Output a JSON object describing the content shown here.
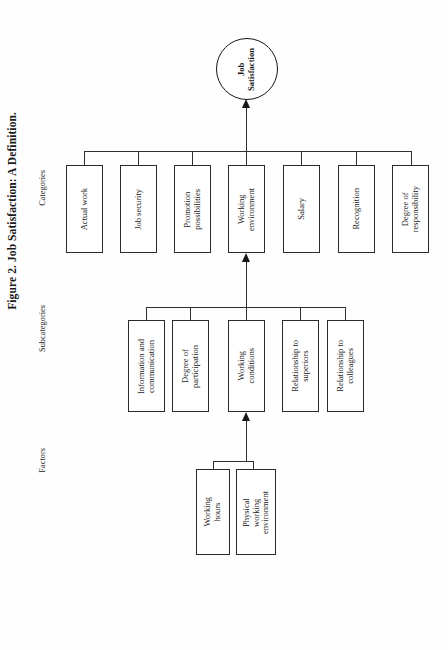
{
  "figure": {
    "title": "Figure 2. Job Satisfaction: A Definition.",
    "root_node": "Job\nSatisfaction"
  },
  "row_labels": {
    "categories": "Categories",
    "subcategories": "Subcategories",
    "factors": "Factors"
  },
  "categories": [
    {
      "label": "Actual work"
    },
    {
      "label": "Job security"
    },
    {
      "label": "Promotion\npossibilities"
    },
    {
      "label": "Working\nenvironment"
    },
    {
      "label": "Salary"
    },
    {
      "label": "Recognition"
    },
    {
      "label": "Degree of\nresponsibility"
    }
  ],
  "subcategories": [
    {
      "label": "Information and\ncommunication"
    },
    {
      "label": "Degree of\nparticipation"
    },
    {
      "label": "Working\nconditions"
    },
    {
      "label": "Relationship to\nsuperiors"
    },
    {
      "label": "Relationship to\ncolleagues"
    }
  ],
  "factors": [
    {
      "label": "Working\nhours"
    },
    {
      "label": "Physical\nworking\nenvironment"
    }
  ],
  "colors": {
    "ink": "#1a1a1a",
    "line": "#2e2e2e",
    "paper": "#fefefe"
  }
}
